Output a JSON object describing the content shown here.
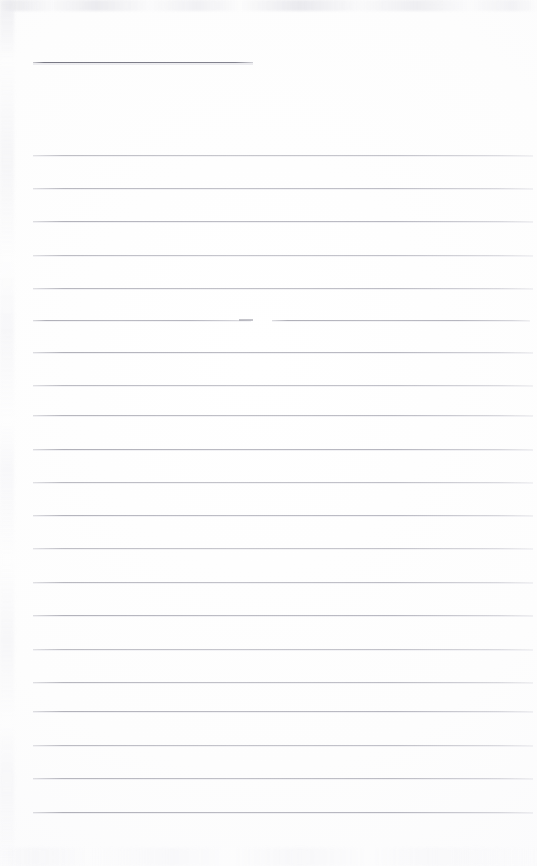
{
  "document": {
    "kind": "scanned-ruled-notebook-page",
    "page_width": 537,
    "page_height": 866,
    "background_color": "#fdfdfd",
    "rule_color": "#b4b4bd",
    "heading_rule_color": "#7e7e8a",
    "text_content": "",
    "body_text_lines": []
  },
  "heading_rule": {
    "name": "heading-underline",
    "x": 33,
    "y": 62,
    "width": 220,
    "color": "#7e7e8a"
  },
  "broken_rule": {
    "name": "broken-rule-row-6",
    "y": 320,
    "left_segment": {
      "x": 33,
      "width": 218
    },
    "right_segment": {
      "x": 272,
      "width": 258
    }
  },
  "rules": [
    {
      "y": 155,
      "x": 33,
      "width": 500
    },
    {
      "y": 188,
      "x": 33,
      "width": 500
    },
    {
      "y": 221,
      "x": 33,
      "width": 500
    },
    {
      "y": 255,
      "x": 33,
      "width": 500
    },
    {
      "y": 288,
      "x": 33,
      "width": 500
    },
    {
      "y": 352,
      "x": 33,
      "width": 500
    },
    {
      "y": 385,
      "x": 33,
      "width": 500
    },
    {
      "y": 415,
      "x": 33,
      "width": 500
    },
    {
      "y": 449,
      "x": 33,
      "width": 500
    },
    {
      "y": 482,
      "x": 33,
      "width": 500
    },
    {
      "y": 515,
      "x": 33,
      "width": 500
    },
    {
      "y": 548,
      "x": 33,
      "width": 500
    },
    {
      "y": 582,
      "x": 33,
      "width": 500
    },
    {
      "y": 615,
      "x": 33,
      "width": 500
    },
    {
      "y": 649,
      "x": 33,
      "width": 500
    },
    {
      "y": 682,
      "x": 33,
      "width": 500
    },
    {
      "y": 711,
      "x": 33,
      "width": 500
    },
    {
      "y": 745,
      "x": 33,
      "width": 500
    },
    {
      "y": 778,
      "x": 33,
      "width": 500
    },
    {
      "y": 812,
      "x": 33,
      "width": 500
    }
  ]
}
